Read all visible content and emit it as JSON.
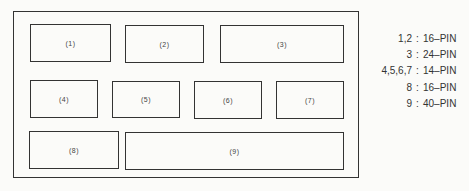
{
  "diagram": {
    "type": "board-layout",
    "frame": {
      "x": 13,
      "y": 11,
      "w": 346,
      "h": 167
    },
    "chips": [
      {
        "label": "(1)",
        "x": 30,
        "y": 24,
        "w": 81,
        "h": 38
      },
      {
        "label": "(2)",
        "x": 125,
        "y": 25,
        "w": 79,
        "h": 38
      },
      {
        "label": "(3)",
        "x": 220,
        "y": 25,
        "w": 124,
        "h": 38
      },
      {
        "label": "(4)",
        "x": 30,
        "y": 80,
        "w": 68,
        "h": 38
      },
      {
        "label": "(5)",
        "x": 112,
        "y": 81,
        "w": 68,
        "h": 37
      },
      {
        "label": "(6)",
        "x": 194,
        "y": 81,
        "w": 68,
        "h": 38
      },
      {
        "label": "(7)",
        "x": 276,
        "y": 81,
        "w": 68,
        "h": 38
      },
      {
        "label": "(8)",
        "x": 29,
        "y": 131,
        "w": 90,
        "h": 38
      },
      {
        "label": "(9)",
        "x": 125,
        "y": 132,
        "w": 219,
        "h": 38
      }
    ],
    "legend": [
      {
        "key": "1,2",
        "sep": ":",
        "value": "16–PIN"
      },
      {
        "key": "3",
        "sep": ":",
        "value": "24–PIN"
      },
      {
        "key": "4,5,6,7",
        "sep": ":",
        "value": "14–PIN"
      },
      {
        "key": "8",
        "sep": ":",
        "value": "16–PIN"
      },
      {
        "key": "9",
        "sep": ":",
        "value": "40–PIN"
      }
    ]
  }
}
